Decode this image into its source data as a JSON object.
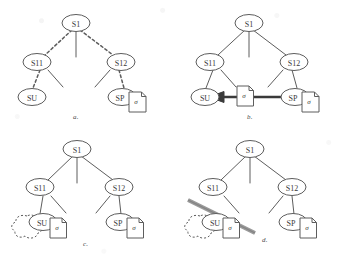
{
  "figure": {
    "panels": [
      {
        "id": "a",
        "caption": "a.",
        "edge_style": "dotted",
        "nodes": [
          {
            "id": "root",
            "label": "S1"
          },
          {
            "id": "left",
            "label": "S11"
          },
          {
            "id": "right",
            "label": "S12"
          },
          {
            "id": "su",
            "label": "SU"
          },
          {
            "id": "sp",
            "label": "SP"
          }
        ],
        "document_icons": [
          {
            "attached_to": "sp",
            "glyph": "σ"
          }
        ],
        "annotations": []
      },
      {
        "id": "b",
        "caption": "b.",
        "edge_style": "solid",
        "nodes": [
          {
            "id": "root",
            "label": "S1"
          },
          {
            "id": "left",
            "label": "S11"
          },
          {
            "id": "right",
            "label": "S12"
          },
          {
            "id": "su",
            "label": "SU"
          },
          {
            "id": "sp",
            "label": "SP"
          }
        ],
        "document_icons": [
          {
            "attached_to": "transfer",
            "glyph": "σ"
          },
          {
            "attached_to": "sp",
            "glyph": "σ"
          }
        ],
        "annotations": [
          {
            "type": "arrow",
            "from": "sp",
            "to": "su",
            "direction": "left",
            "style": "thick-solid"
          }
        ]
      },
      {
        "id": "c",
        "caption": "c.",
        "edge_style": "solid",
        "nodes": [
          {
            "id": "root",
            "label": "S1"
          },
          {
            "id": "left",
            "label": "S11"
          },
          {
            "id": "right",
            "label": "S12"
          },
          {
            "id": "su",
            "label": "SU"
          },
          {
            "id": "sp",
            "label": "SP"
          }
        ],
        "document_icons": [
          {
            "attached_to": "su",
            "glyph": "σ"
          },
          {
            "attached_to": "sp",
            "glyph": "σ"
          }
        ],
        "annotations": [
          {
            "type": "cloud",
            "near": "su",
            "style": "dashed"
          }
        ]
      },
      {
        "id": "d",
        "caption": "d.",
        "edge_style": "solid",
        "nodes": [
          {
            "id": "root",
            "label": "S1"
          },
          {
            "id": "left",
            "label": "S11"
          },
          {
            "id": "right",
            "label": "S12"
          },
          {
            "id": "su",
            "label": "SU"
          },
          {
            "id": "sp",
            "label": "SP"
          }
        ],
        "document_icons": [
          {
            "attached_to": "su",
            "glyph": "σ"
          },
          {
            "attached_to": "sp",
            "glyph": "σ"
          }
        ],
        "annotations": [
          {
            "type": "cloud",
            "near": "su",
            "style": "dashed"
          },
          {
            "type": "slash",
            "severs_edge": "left-to-su",
            "style": "thick-diagonal"
          }
        ]
      }
    ],
    "colors": {
      "ink": "#5d5d5d",
      "ink_dark": "#3a3a3a",
      "slash": "#8a8a8a",
      "paper": "#ffffff"
    }
  }
}
